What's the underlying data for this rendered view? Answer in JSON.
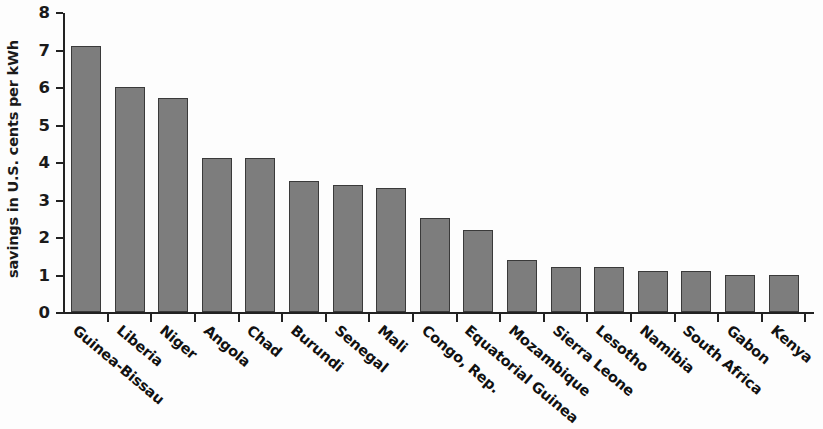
{
  "chart_data": {
    "type": "bar",
    "title": "",
    "xlabel": "",
    "ylabel": "savings in U.S. cents per kWh",
    "ylim": [
      0,
      8
    ],
    "yticks": [
      0,
      1,
      2,
      3,
      4,
      5,
      6,
      7,
      8
    ],
    "ytick_labels": [
      "0",
      "1",
      "2",
      "3",
      "4",
      "5",
      "6",
      "7",
      "8"
    ],
    "grid": false,
    "legend": null,
    "bar_color": "#7d7d7d",
    "bar_edge_color": "#3a3a3a",
    "background_color": "#fdfdfd",
    "axis_color": "#222222",
    "categories": [
      "Guinea-Bissau",
      "Liberia",
      "Niger",
      "Angola",
      "Chad",
      "Burundi",
      "Senegal",
      "Mali",
      "Congo, Rep.",
      "Equatorial Guinea",
      "Mozambique",
      "Sierra Leone",
      "Lesotho",
      "Namibia",
      "South Africa",
      "Gabon",
      "Kenya"
    ],
    "values": [
      7.1,
      6.0,
      5.7,
      4.1,
      4.1,
      3.5,
      3.4,
      3.3,
      2.5,
      2.2,
      1.4,
      1.2,
      1.2,
      1.1,
      1.1,
      1.0,
      1.0
    ]
  }
}
